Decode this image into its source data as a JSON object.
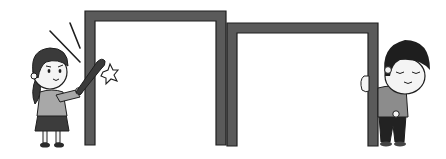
{
  "scene": {
    "description": "Illustration: girl hitting a door frame with a bat; boy peeking from behind a second door frame",
    "colors": {
      "background": "#ffffff",
      "frame_fill": "#5a5a5a",
      "frame_outline": "#1e1e1e",
      "hair": "#3a3a3a",
      "skin": "#f4f4f4",
      "shirt_girl": "#a8a8a8",
      "skirt": "#3c3c3c",
      "shirt_boy": "#8c8c8c",
      "pants_boy": "#222222",
      "bat": "#3a3a3a"
    },
    "frames": [
      {
        "name": "left-door-frame",
        "x": 85,
        "y": 11,
        "w": 141,
        "h": 134,
        "thickness": 10
      },
      {
        "name": "right-door-frame",
        "x": 226,
        "y": 23,
        "w": 152,
        "h": 123,
        "thickness": 10
      }
    ]
  }
}
